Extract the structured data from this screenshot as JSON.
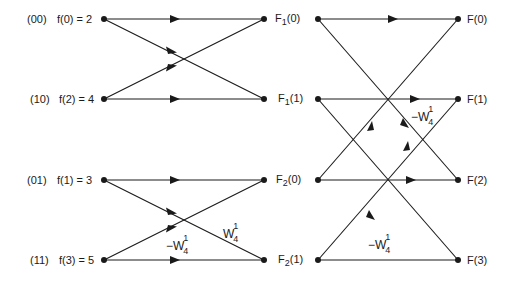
{
  "diagram": {
    "type": "fft-butterfly",
    "points": 4,
    "line_color": "#1a1a1a",
    "inputs": [
      {
        "index_bits": "(00)",
        "label": "f(0) = 2"
      },
      {
        "index_bits": "(10)",
        "label": "f(2) = 4"
      },
      {
        "index_bits": "(01)",
        "label": "f(1) = 3"
      },
      {
        "index_bits": "(11)",
        "label": "f(3) = 5"
      }
    ],
    "intermediate": [
      {
        "name": "F",
        "sub": "1",
        "arg": "(0)"
      },
      {
        "name": "F",
        "sub": "1",
        "arg": "(1)"
      },
      {
        "name": "F",
        "sub": "2",
        "arg": "(0)"
      },
      {
        "name": "F",
        "sub": "2",
        "arg": "(1)"
      }
    ],
    "outputs": [
      {
        "label": "F(0)"
      },
      {
        "label": "F(1)"
      },
      {
        "label": "F(2)"
      },
      {
        "label": "F(3)"
      }
    ],
    "twiddles": {
      "stage1_w": {
        "base": "W",
        "sup": "1",
        "sub": "4"
      },
      "stage1_neg_w": {
        "base": "−W",
        "sup": "1",
        "sub": "4"
      },
      "stage2_f1_neg_w": {
        "base": "−W",
        "sup": "1",
        "sub": "4"
      },
      "stage2_f3_neg_w": {
        "base": "−W",
        "sup": "1",
        "sub": "4"
      }
    }
  }
}
